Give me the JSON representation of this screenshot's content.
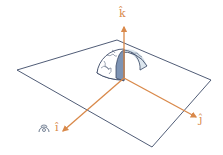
{
  "diagram": {
    "axes": [
      {
        "name": "i",
        "label": "î",
        "direction": "toward viewer (lower-left)"
      },
      {
        "name": "j",
        "label": "ĵ",
        "direction": "lower-right"
      },
      {
        "name": "k",
        "label": "k̂",
        "direction": "up"
      }
    ],
    "viewer_symbol": "eye-icon",
    "colors": {
      "axis": "#d9894a",
      "plane_outline": "#3c4a66",
      "globe_outline": "#3c4a66",
      "globe_shadow": "#7d93b3",
      "globe_light": "#dce6ee"
    }
  },
  "labels": {
    "k": "k̂",
    "j": "ĵ",
    "i": "î",
    "eye": "👁"
  }
}
